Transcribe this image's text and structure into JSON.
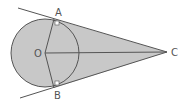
{
  "diagram": {
    "title": "",
    "type": "geometry",
    "points": {
      "O": {
        "label": "O",
        "x": 45,
        "y": 53
      },
      "A": {
        "label": "A",
        "x": 54,
        "y": 19
      },
      "B": {
        "label": "B",
        "x": 54,
        "y": 88
      },
      "C": {
        "label": "C",
        "x": 167,
        "y": 52
      }
    },
    "circle": {
      "cx": 45,
      "cy": 53,
      "r": 34
    },
    "colors": {
      "fill": "#c8c8c8",
      "stroke": "#555555",
      "background": "#ffffff"
    },
    "right_angle_marks": [
      "A",
      "B"
    ]
  }
}
